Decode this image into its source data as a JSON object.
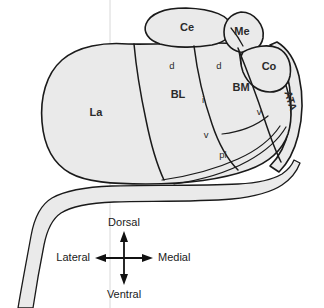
{
  "figure": {
    "background_color": "#ffffff",
    "region_fill_color": "#eaeaea",
    "outline_color": "#1a1a1a",
    "guide_line_color": "#d8d8d8",
    "label_color": "#2a2a2a"
  },
  "regions": [
    {
      "id": "ce",
      "label": "Ce",
      "name": "central-nucleus",
      "x": 187,
      "y": 28,
      "size": "major"
    },
    {
      "id": "me",
      "label": "Me",
      "name": "medial-nucleus",
      "x": 242,
      "y": 32,
      "size": "major"
    },
    {
      "id": "co",
      "label": "Co",
      "name": "cortical-nucleus",
      "x": 269,
      "y": 67,
      "size": "major"
    },
    {
      "id": "la",
      "label": "La",
      "name": "lateral-nucleus",
      "x": 96,
      "y": 113,
      "size": "major"
    },
    {
      "id": "bl",
      "label": "BL",
      "name": "basolateral-nucleus",
      "x": 178,
      "y": 95,
      "size": "major"
    },
    {
      "id": "bm",
      "label": "BM",
      "name": "basomedial-nucleus",
      "x": 241,
      "y": 88,
      "size": "major"
    },
    {
      "id": "ata",
      "label": "ATA",
      "name": "amygdalo-temporal-area",
      "x": 290,
      "y": 101,
      "size": "rotated",
      "rotation": 72
    },
    {
      "id": "bl-d",
      "label": "d",
      "name": "basolateral-dorsal-subdivision",
      "x": 172,
      "y": 66,
      "size": "sub"
    },
    {
      "id": "bl-i",
      "label": "i",
      "name": "basolateral-intermediate-subdivision",
      "x": 203,
      "y": 100,
      "size": "sub"
    },
    {
      "id": "bl-v",
      "label": "v",
      "name": "basolateral-ventral-subdivision",
      "x": 206,
      "y": 135,
      "size": "sub"
    },
    {
      "id": "bl-pl",
      "label": "pl",
      "name": "basolateral-paralaminar-subdivision",
      "x": 223,
      "y": 155,
      "size": "sub"
    },
    {
      "id": "bm-d",
      "label": "d",
      "name": "basomedial-dorsal-subdivision",
      "x": 219,
      "y": 66,
      "size": "sub"
    },
    {
      "id": "bm-v",
      "label": "v",
      "name": "basomedial-ventral-subdivision",
      "x": 259,
      "y": 112,
      "size": "sub"
    }
  ],
  "compass": {
    "name": "orientation-compass",
    "center_x": 124,
    "center_y": 258,
    "arm_length": 26,
    "dorsal": "Dorsal",
    "ventral": "Ventral",
    "lateral": "Lateral",
    "medial": "Medial"
  }
}
